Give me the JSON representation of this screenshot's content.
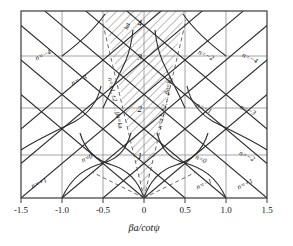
{
  "chart_data": {
    "type": "line",
    "title": "",
    "xlabel": "βa/cotψ",
    "ylabel": "",
    "xlim": [
      -1.5,
      1.5
    ],
    "ylim": [
      0,
      4.3
    ],
    "grid": true,
    "legend": null,
    "xticks": [
      "-1.5",
      "-1.0",
      "-0.5",
      "0",
      "0.5",
      "1.0",
      "1.5"
    ],
    "xtick_values": [
      -1.5,
      -1.0,
      -0.5,
      0,
      0.5,
      1.0,
      1.5
    ],
    "yticks": [
      "1",
      "2",
      "3",
      "4"
    ],
    "ytick_values": [
      1,
      2,
      3,
      4
    ],
    "series": [
      {
        "name": "lattice-lines-positive-slope",
        "type": "diagonal-family"
      },
      {
        "name": "lattice-lines-negative-slope",
        "type": "diagonal-family"
      },
      {
        "name": "cone-boundary-left",
        "slope": -4.6,
        "type": "ray"
      },
      {
        "name": "cone-boundary-right",
        "slope": 4.6,
        "type": "ray"
      },
      {
        "name": "hyperbolic-branches",
        "type": "curve-family"
      },
      {
        "name": "dashed-asymptote",
        "type": "dashed"
      }
    ]
  },
  "axis": {
    "x_label": "βa/cotψ",
    "x_ticks": [
      "-1.5",
      "-1.0",
      "-0.5",
      "0",
      "0.5",
      "1.0",
      "1.5"
    ],
    "y_ticks": [
      "1",
      "2",
      "3",
      "4"
    ]
  },
  "annotations": {
    "cone_left": "n=±1, ±2, … βa=ka",
    "cone_right": "n=±1, ±2, … βa=ka",
    "dashed_top": "ka",
    "mode_labels": [
      {
        "id": "n-minus-4-left",
        "text": "n=−4",
        "x": 44,
        "y": 57,
        "rot": -26
      },
      {
        "id": "n-minus-3-left",
        "text": "n=−3",
        "x": 80,
        "y": 82,
        "rot": -26
      },
      {
        "id": "n-zero-left",
        "text": "n=0",
        "x": 88,
        "y": 160,
        "rot": -26
      },
      {
        "id": "n-plus-1-left",
        "text": "n=+1",
        "x": 40,
        "y": 185,
        "rot": -26
      },
      {
        "id": "n-minus-2-right",
        "text": "n=−2",
        "x": 205,
        "y": 57,
        "rot": 26
      },
      {
        "id": "n-minus-4-right",
        "text": "n=−4",
        "x": 249,
        "y": 60,
        "rot": 26
      },
      {
        "id": "n-minus-1-right",
        "text": "n=−1",
        "x": 203,
        "y": 110,
        "rot": 26
      },
      {
        "id": "n-minus-3-right",
        "text": "n=−3",
        "x": 247,
        "y": 112,
        "rot": 26
      },
      {
        "id": "n-zero-right",
        "text": "n=0",
        "x": 200,
        "y": 161,
        "rot": 26
      },
      {
        "id": "n-minus-2-far",
        "text": "n=−2",
        "x": 246,
        "y": 158,
        "rot": 26
      },
      {
        "id": "n-minus-1-bot",
        "text": "n=−1",
        "x": 205,
        "y": 186,
        "rot": -26
      },
      {
        "id": "n-plus-1-bot",
        "text": "n=+1",
        "x": 246,
        "y": 186,
        "rot": -26
      }
    ]
  }
}
